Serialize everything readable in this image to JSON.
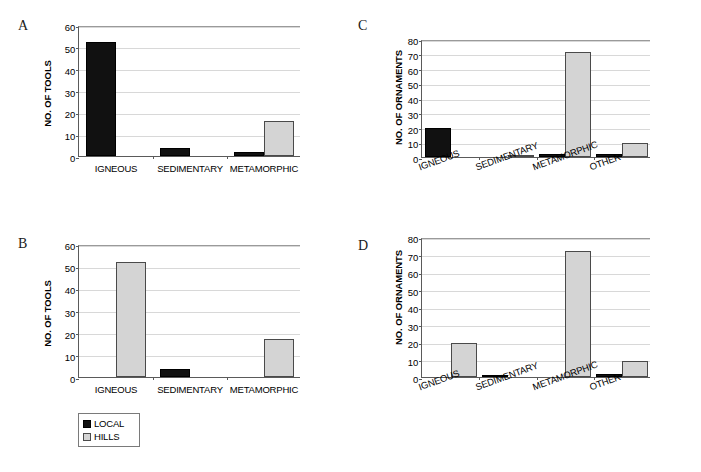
{
  "figure": {
    "legend": {
      "items": [
        {
          "label": "LOCAL",
          "swatch": "local",
          "color": "#111111"
        },
        {
          "label": "HILLS",
          "swatch": "hills",
          "color": "#d4d4d4"
        }
      ]
    },
    "panels": [
      {
        "letter": "A",
        "ylabel": "NO. OF TOOLS",
        "yticks": [
          "0",
          "10",
          "20",
          "30",
          "40",
          "50",
          "60"
        ],
        "categories": [
          "IGNEOUS",
          "SEDIMENTARY",
          "METAMORPHIC"
        ]
      },
      {
        "letter": "B",
        "ylabel": "NO. OF TOOLS",
        "yticks": [
          "0",
          "10",
          "20",
          "30",
          "40",
          "50",
          "60"
        ],
        "categories": [
          "IGNEOUS",
          "SEDIMENTARY",
          "METAMORPHIC"
        ]
      },
      {
        "letter": "C",
        "ylabel": "NO. OF ORNAMENTS",
        "yticks": [
          "0",
          "10",
          "20",
          "30",
          "40",
          "50",
          "60",
          "70",
          "80"
        ],
        "categories": [
          "IGNEOUS",
          "SEDIMENTARY",
          "METAMORPHIC",
          "OTHER"
        ]
      },
      {
        "letter": "D",
        "ylabel": "NO. OF ORNAMENTS",
        "yticks": [
          "0",
          "10",
          "20",
          "30",
          "40",
          "50",
          "60",
          "70",
          "80"
        ],
        "categories": [
          "IGNEOUS",
          "SEDIMENTARY",
          "METAMORPHIC",
          "OTHER"
        ]
      }
    ]
  },
  "chart_data": [
    {
      "id": "A",
      "type": "bar",
      "title": "A",
      "xlabel": "",
      "ylabel": "NO. OF TOOLS",
      "ylim": [
        0,
        60
      ],
      "ytick_step": 10,
      "grid": true,
      "legend_position": "external-bottom-left",
      "label_rotation": 0,
      "categories": [
        "IGNEOUS",
        "SEDIMENTARY",
        "METAMORPHIC"
      ],
      "series": [
        {
          "name": "LOCAL",
          "color": "#111111",
          "values": [
            52,
            3.5,
            2
          ]
        },
        {
          "name": "HILLS",
          "color": "#d4d4d4",
          "values": [
            0,
            0,
            16
          ]
        }
      ]
    },
    {
      "id": "B",
      "type": "bar",
      "title": "B",
      "xlabel": "",
      "ylabel": "NO. OF TOOLS",
      "ylim": [
        0,
        60
      ],
      "ytick_step": 10,
      "grid": true,
      "legend_position": "external-bottom-left",
      "label_rotation": 0,
      "categories": [
        "IGNEOUS",
        "SEDIMENTARY",
        "METAMORPHIC"
      ],
      "series": [
        {
          "name": "LOCAL",
          "color": "#111111",
          "values": [
            0,
            3.5,
            0
          ]
        },
        {
          "name": "HILLS",
          "color": "#d4d4d4",
          "values": [
            52,
            0,
            17
          ]
        }
      ]
    },
    {
      "id": "C",
      "type": "bar",
      "title": "C",
      "xlabel": "",
      "ylabel": "NO. OF ORNAMENTS",
      "ylim": [
        0,
        80
      ],
      "ytick_step": 10,
      "grid": true,
      "legend_position": "external-bottom-left",
      "label_rotation": -20,
      "categories": [
        "IGNEOUS",
        "SEDIMENTARY",
        "METAMORPHIC",
        "OTHER"
      ],
      "series": [
        {
          "name": "LOCAL",
          "color": "#111111",
          "values": [
            19.5,
            0,
            2,
            2
          ]
        },
        {
          "name": "HILLS",
          "color": "#d4d4d4",
          "values": [
            0,
            1.3,
            71,
            9.5
          ]
        }
      ]
    },
    {
      "id": "D",
      "type": "bar",
      "title": "D",
      "xlabel": "",
      "ylabel": "NO. OF ORNAMENTS",
      "ylim": [
        0,
        80
      ],
      "ytick_step": 10,
      "grid": true,
      "legend_position": "external-bottom-left",
      "label_rotation": -20,
      "categories": [
        "IGNEOUS",
        "SEDIMENTARY",
        "METAMORPHIC",
        "OTHER"
      ],
      "series": [
        {
          "name": "LOCAL",
          "color": "#111111",
          "values": [
            0,
            1.3,
            0,
            2
          ]
        },
        {
          "name": "HILLS",
          "color": "#d4d4d4",
          "values": [
            19.5,
            0,
            72,
            9.3
          ]
        }
      ]
    }
  ]
}
